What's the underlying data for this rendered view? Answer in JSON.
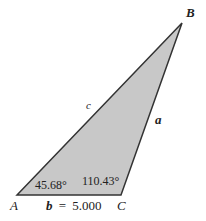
{
  "diagram": {
    "type": "triangle",
    "fill_color": "#c8c8c8",
    "stroke_color": "#333333",
    "vertices": [
      {
        "name": "A",
        "x": 17,
        "y": 195
      },
      {
        "name": "B",
        "x": 182,
        "y": 23
      },
      {
        "name": "C",
        "x": 121,
        "y": 195
      }
    ],
    "vertex_labels": {
      "A": "A",
      "B": "B",
      "C": "C"
    },
    "side_labels": {
      "a": "a",
      "b_name": "b",
      "b_eq": "=",
      "b_value": "5.000",
      "c": "c"
    },
    "angles": {
      "A": "45.68°",
      "C": "110.43°"
    }
  }
}
